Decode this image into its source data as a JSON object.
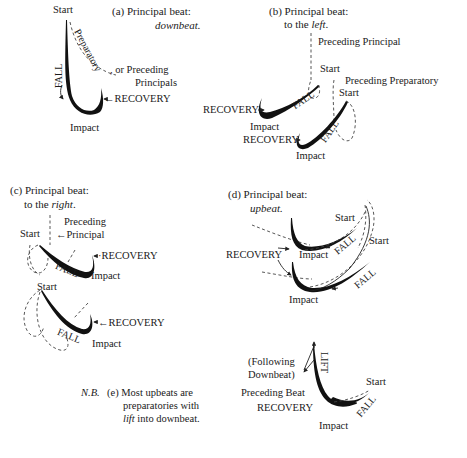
{
  "panels": {
    "a": {
      "title_line1": "(a)  Principal beat:",
      "title_line2": "downbeat",
      "title_line2_suffix": ".",
      "labels": {
        "start": "Start",
        "preparatory": "Preparatory",
        "or_preceding": ", or Preceding",
        "principals": "Principals",
        "fall": "FALL",
        "recovery": "←RECOVERY",
        "impact": "Impact"
      }
    },
    "b": {
      "title_line1": "(b) Principal beat:",
      "title_line2_prefix": "to the ",
      "title_line2_em": "left",
      "title_line2_suffix": ".",
      "labels": {
        "preceding_principal": "Preceding Principal",
        "start_1": "Start",
        "preceding_preparatory": "Preceding Preparatory",
        "start_2": "Start",
        "fall_1": "FALL",
        "fall_2": "FALL",
        "recovery_1": "RECOVERY",
        "recovery_2": "RECOVERY",
        "impact_1": "Impact",
        "impact_2": "Impact"
      }
    },
    "c": {
      "title_line1": "(c) Principal beat:",
      "title_line2_prefix": "to the ",
      "title_line2_em": "right",
      "title_line2_suffix": ".",
      "labels": {
        "preceding": "Preceding",
        "principal": "Principal",
        "start_1": "Start",
        "start_2": "Start",
        "recovery_1": "RECOVERY",
        "recovery_2": "RECOVERY",
        "fall_1": "FALL",
        "fall_2": "FALL",
        "impact_1": "Impact",
        "impact_2": "Impact"
      }
    },
    "d": {
      "title_line1": "(d) Principal beat:",
      "title_line2": "upbeat",
      "title_line2_suffix": ".",
      "labels": {
        "recovery": "RECOVERY",
        "start_1": "Start",
        "start_2": "Start",
        "fall_1": "FALL",
        "fall_2": "FALL",
        "impact_1": "Impact",
        "impact_2": "Impact"
      }
    },
    "e": {
      "nb": "N.B.",
      "line1": "(e) Most upbeats are",
      "line2": "preparatories with",
      "line3_em": "lift",
      "line3_rest": " into downbeat.",
      "labels": {
        "following_1": "(Following",
        "following_2": "Downbeat)",
        "lift": "LIFT",
        "preceding_beat": "Preceding Beat",
        "recovery": "RECOVERY",
        "start": "Start",
        "fall": "FALL",
        "impact": "Impact"
      }
    }
  }
}
